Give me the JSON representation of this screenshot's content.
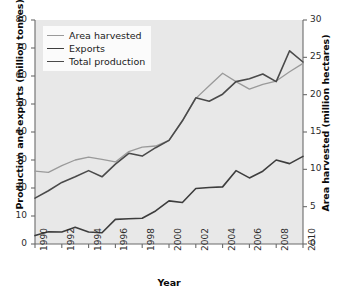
{
  "chart_data": {
    "type": "line",
    "title": "",
    "xlabel": "Year",
    "ylabel": "Production and exports (million tonnes)",
    "ylabel_right": "Area harvested (million hectares)",
    "x": [
      1990,
      1991,
      1992,
      1993,
      1994,
      1995,
      1996,
      1997,
      1998,
      1999,
      2000,
      2001,
      2002,
      2003,
      2004,
      2005,
      2006,
      2007,
      2008,
      2009,
      2010
    ],
    "xlim": [
      1990,
      2010
    ],
    "xticks": [
      "1990",
      "1992",
      "1994",
      "1996",
      "1998",
      "2000",
      "2002",
      "2004",
      "2006",
      "2008",
      "2010"
    ],
    "ylim": [
      0,
      80
    ],
    "yticks": [
      "0",
      "10",
      "20",
      "30",
      "40",
      "50",
      "60",
      "70",
      "80"
    ],
    "ylim_right": [
      0,
      30
    ],
    "yticks_right": [
      "0",
      "5",
      "10",
      "15",
      "20",
      "25",
      "30"
    ],
    "grid": false,
    "legend_position": "top-left",
    "series": [
      {
        "name": "Area harvested",
        "axis": "right",
        "color": "#9a9a9a",
        "width": 1.3,
        "values_left_scale": [
          26.0,
          25.6,
          28.0,
          30.0,
          31.0,
          30.2,
          29.3,
          33.0,
          34.6,
          35.0,
          37.0,
          44.0,
          52.0,
          56.5,
          61.0,
          58.0,
          55.3,
          57.0,
          58.2,
          61.5,
          64.5
        ],
        "values": [
          9.75,
          9.6,
          10.5,
          11.25,
          11.63,
          11.33,
          10.99,
          12.38,
          12.98,
          13.13,
          13.88,
          16.5,
          19.5,
          21.19,
          22.88,
          21.75,
          20.74,
          21.38,
          21.83,
          23.06,
          24.19
        ]
      },
      {
        "name": "Exports",
        "axis": "left",
        "color": "#3d3d3d",
        "width": 1.6,
        "values": [
          3.0,
          4.4,
          4.3,
          6.0,
          4.3,
          4.0,
          8.8,
          9.0,
          9.2,
          11.8,
          15.4,
          14.8,
          19.8,
          20.2,
          20.4,
          26.2,
          23.6,
          26.0,
          30.0,
          28.7,
          31.3
        ]
      },
      {
        "name": "Total production",
        "axis": "left",
        "color": "#4a4a4a",
        "width": 1.6,
        "values": [
          16.4,
          19.0,
          22.0,
          24.0,
          26.2,
          24.0,
          28.5,
          32.4,
          31.4,
          34.4,
          37.0,
          44.0,
          52.2,
          51.0,
          53.5,
          58.0,
          59.0,
          60.7,
          58.0,
          69.0,
          65.0
        ]
      }
    ]
  },
  "legend": {
    "items": [
      {
        "label": "Area harvested"
      },
      {
        "label": "Exports"
      },
      {
        "label": "Total production"
      }
    ]
  }
}
